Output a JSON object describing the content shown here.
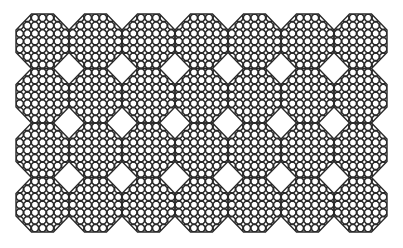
{
  "pattern": {
    "description": "Octagonal tiles each filled with a grid of small octagons",
    "columns": 7,
    "rows": 4,
    "origin_x": 16,
    "origin_y": 14,
    "tile_width": 53,
    "tile_height": 54.5,
    "inner_grid": 7,
    "stroke_color": "#2a2a2a",
    "background": "#ffffff"
  }
}
